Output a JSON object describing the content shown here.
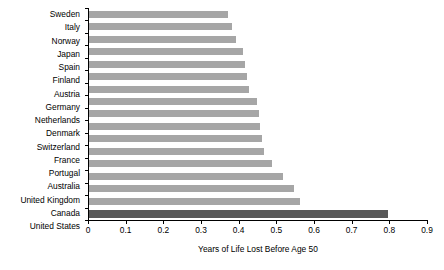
{
  "chart_data": {
    "type": "bar",
    "orientation": "horizontal",
    "title": "",
    "xlabel": "Years of Life Lost Before Age 50",
    "ylabel": "",
    "xlim": [
      0,
      0.9
    ],
    "xticks": [
      0,
      0.1,
      0.2,
      0.3,
      0.4,
      0.5,
      0.6,
      0.7,
      0.8,
      0.9
    ],
    "xticklabels": [
      "0",
      "0.1",
      "0.2",
      "0.3",
      "0.4",
      "0.5",
      "0.6",
      "0.7",
      "0.8",
      "0.9"
    ],
    "grid": false,
    "legend": null,
    "categories": [
      "Sweden",
      "Italy",
      "Norway",
      "Japan",
      "Spain",
      "Finland",
      "Austria",
      "Germany",
      "Netherlands",
      "Denmark",
      "Switzerland",
      "France",
      "Portugal",
      "Australia",
      "United Kingdom",
      "Canada",
      "United States"
    ],
    "values": [
      0.37,
      0.38,
      0.39,
      0.41,
      0.415,
      0.42,
      0.425,
      0.445,
      0.45,
      0.455,
      0.46,
      0.465,
      0.485,
      0.515,
      0.545,
      0.56,
      0.795
    ],
    "highlight_category": "United States",
    "colors": {
      "bar": "#a6a6a6",
      "highlight_bar": "#595959",
      "axis": "#000000",
      "text": "#000000",
      "background": "#ffffff"
    }
  }
}
